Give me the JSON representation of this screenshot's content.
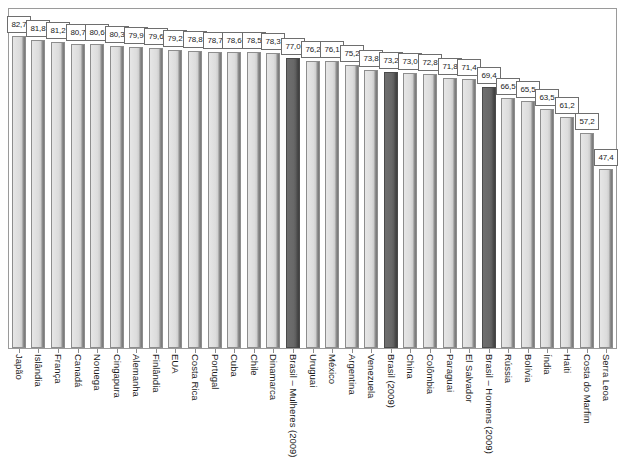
{
  "chart_data": {
    "type": "bar",
    "title": "",
    "subtitle": "",
    "xlabel": "",
    "ylabel": "",
    "ylim": [
      0,
      90
    ],
    "grid": false,
    "legend": "none",
    "orientation": "vertical",
    "value_labels_boxed": true,
    "highlight_color": "#5e5e5e",
    "bar_color": "#dcdcdc",
    "border_color": "#8d8d8d",
    "categories": [
      "Japão",
      "Islândia",
      "França",
      "Canadá",
      "Noruega",
      "Cingapura",
      "Alemanha",
      "Finlândia",
      "EUA",
      "Costa Rica",
      "Portugal",
      "Cuba",
      "Chile",
      "Dinamarca",
      "Brasil – Mulheres (2009)",
      "Uruguai",
      "México",
      "Argentina",
      "Venezuela",
      "Brasil (2009)",
      "China",
      "Colômbia",
      "Paraguai",
      "El Salvador",
      "Brasil – Homens (2009)",
      "Rússia",
      "Bolívia",
      "Índia",
      "Haiti",
      "Costa do Marfim",
      "Serra Leoa"
    ],
    "values": [
      82.7,
      81.8,
      81.2,
      80.7,
      80.6,
      80.3,
      79.9,
      79.6,
      79.2,
      78.8,
      78.7,
      78.6,
      78.5,
      78.3,
      77.0,
      76.2,
      76.1,
      75.2,
      73.8,
      73.2,
      73.0,
      72.8,
      71.8,
      71.4,
      69.4,
      66.5,
      65.5,
      63.5,
      61.2,
      57.2,
      47.4
    ],
    "value_labels": [
      "82,7",
      "81,8",
      "81,2",
      "80,7",
      "80,6",
      "80,3",
      "79,9",
      "79,6",
      "79,2",
      "78,8",
      "78,7",
      "78,6",
      "78,5",
      "78,3",
      "77,0",
      "76,2",
      "76,1",
      "75,2",
      "73,8",
      "73,2",
      "73,0",
      "72,8",
      "71,8",
      "71,4",
      "69,4",
      "66,5",
      "65,5",
      "63,5",
      "61,2",
      "57,2",
      "47,4"
    ],
    "highlighted": [
      false,
      false,
      false,
      false,
      false,
      false,
      false,
      false,
      false,
      false,
      false,
      false,
      false,
      false,
      true,
      false,
      false,
      false,
      false,
      true,
      false,
      false,
      false,
      false,
      true,
      false,
      false,
      false,
      false,
      false,
      false
    ]
  }
}
